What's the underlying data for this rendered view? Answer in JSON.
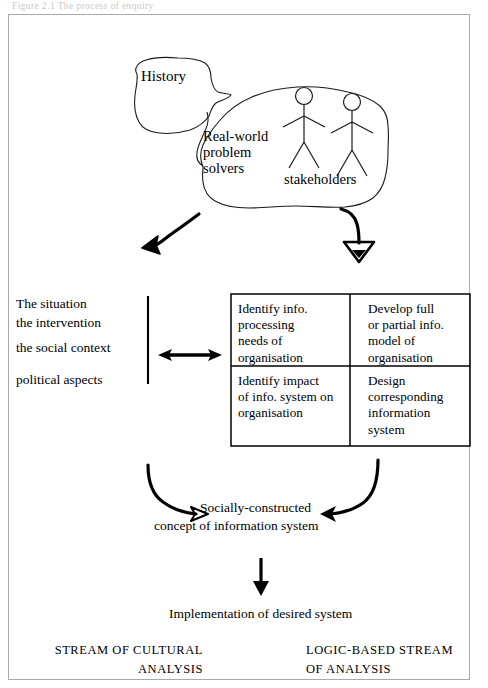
{
  "figure": {
    "title_bleed_top": "Figure 2.1   The process of enquiry",
    "blob_labels": {
      "history": "History",
      "real_world": "Real-world\nproblem\nsolvers",
      "stakeholders": "stakeholders"
    },
    "left_column": [
      "The situation",
      "the intervention",
      "the social context",
      "political aspects"
    ],
    "matrix": {
      "rows": [
        {
          "left": "Identify info.\nprocessing\nneeds of\norganisation",
          "right": "Develop full\nor partial info.\nmodel of\norganisation"
        },
        {
          "left": "Identify impact\nof info. system on\norganisation",
          "right": "Design\ncorresponding\ninformation\nsystem"
        }
      ]
    },
    "concept": {
      "line1": "Socially-constructed",
      "line2": "concept of information system"
    },
    "implementation": "Implementation of desired system",
    "streams": {
      "left": "STREAM OF CULTURAL\nANALYSIS",
      "right": "LOGIC-BASED STREAM\nOF ANALYSIS"
    },
    "colors": {
      "ink": "#000000",
      "frame": "#a9a9a9",
      "blob_outline": "#1a1a1a",
      "bleed": "#d8d8d8",
      "paper": "#ffffff"
    },
    "icons": {
      "figure_people": "stick-figure-icon",
      "thought_blob": "cloud-blob-icon",
      "arrow_down_left": "curved-arrow-down-left-icon",
      "arrow_down_right": "curved-arrow-down-icon",
      "arrow_bidirectional": "double-headed-arrow-icon",
      "arrow_to_concept_left": "curved-arrow-right-icon",
      "arrow_to_concept_right": "curved-arrow-left-icon",
      "arrow_implementation": "arrow-down-icon"
    }
  }
}
